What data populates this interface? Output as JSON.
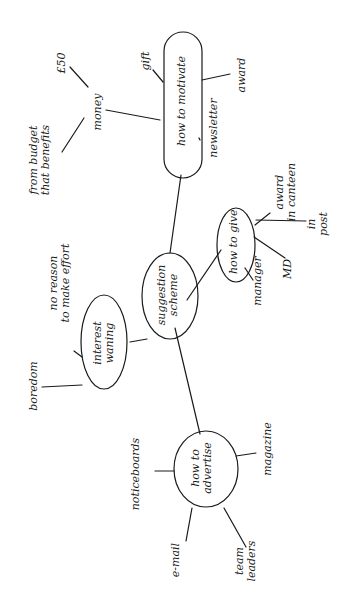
{
  "mindmap": {
    "orientation": "rotated-90-ccw",
    "ink_color": "#1a1a1a",
    "center": {
      "label": "suggestion scheme"
    },
    "branches": [
      {
        "label": "how to motivate",
        "children": [
          {
            "label": "money",
            "children": [
              {
                "label": "£50"
              },
              {
                "label": "from budget that benefits"
              }
            ]
          },
          {
            "label": "gift"
          },
          {
            "label": "newsletter"
          },
          {
            "label": "award"
          }
        ]
      },
      {
        "label": "how to give",
        "children": [
          {
            "label": "award in canteen"
          },
          {
            "label": "in post"
          },
          {
            "label": "MD"
          },
          {
            "label": "manager"
          }
        ]
      },
      {
        "label": "interest waning",
        "children": [
          {
            "label": "no reason to make effort"
          },
          {
            "label": "boredom"
          }
        ]
      },
      {
        "label": "how to advertise",
        "children": [
          {
            "label": "noticeboards"
          },
          {
            "label": "e-mail"
          },
          {
            "label": "team leaders"
          },
          {
            "label": "magazine"
          }
        ]
      }
    ]
  },
  "labels": {
    "center_l1": "suggestion",
    "center_l2": "scheme",
    "motivate": "how to motivate",
    "money": "money",
    "fifty": "£50",
    "budget_l1": "from budget",
    "budget_l2": "that benefits",
    "gift": "gift",
    "newsletter": "newsletter",
    "award": "award",
    "give": "how to give",
    "canteen_l1": "award",
    "canteen_l2": "in canteen",
    "inpost_l1": "in",
    "inpost_l2": "post",
    "md": "MD",
    "manager": "manager",
    "waning_l1": "interest",
    "waning_l2": "waning",
    "noreason_l1": "no reason",
    "noreason_l2": "to make effort",
    "boredom": "boredom",
    "advertise_l1": "how to",
    "advertise_l2": "advertise",
    "noticeboards": "noticeboards",
    "email": "e-mail",
    "team_l1": "team",
    "team_l2": "leaders",
    "magazine": "magazine"
  }
}
